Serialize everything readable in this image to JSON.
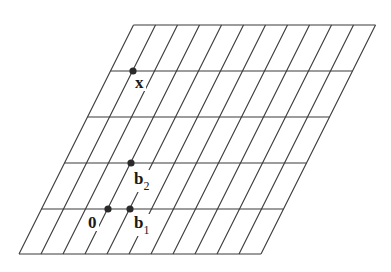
{
  "diagram": {
    "title": "Lattice with basis vectors",
    "colors": {
      "line": "#3a3a3a",
      "point": "#2a2a2a",
      "text": "#1a1a1a",
      "background": "#ffffff"
    },
    "grid": {
      "rows_y": [
        25,
        71,
        117,
        163,
        209,
        254
      ],
      "bottom_y": 254,
      "top_y": 25,
      "bottom_start_x": 19,
      "col_spacing": 22,
      "num_cols": 12,
      "shear": 0.5,
      "left_edge": [
        [
          19,
          254
        ],
        [
          134,
          25
        ]
      ],
      "right_edge": [
        [
          261,
          254
        ],
        [
          374,
          25
        ]
      ]
    },
    "points": [
      {
        "id": "origin",
        "label": "0",
        "subscript": "",
        "x": 108,
        "y": 209,
        "label_x": 88,
        "label_y": 228
      },
      {
        "id": "b1",
        "label": "b",
        "subscript": "1",
        "x": 130,
        "y": 209,
        "label_x": 134,
        "label_y": 228
      },
      {
        "id": "b2",
        "label": "b",
        "subscript": "2",
        "x": 131,
        "y": 163,
        "label_x": 134,
        "label_y": 184
      },
      {
        "id": "x",
        "label": "x",
        "subscript": "",
        "x": 133,
        "y": 71,
        "label_x": 135,
        "label_y": 88
      }
    ]
  }
}
